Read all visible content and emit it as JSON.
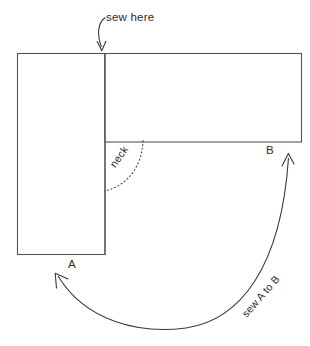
{
  "figure": {
    "background_color": "#ffffff",
    "line_color": "#555555",
    "text_color": "#2b2b2b"
  },
  "labels": {
    "sew_here": "sew here",
    "point_a": "A",
    "point_b": "B",
    "neck": "neck",
    "sew_a_to_b": "sew A to B"
  },
  "shapes": {
    "left_panel": {
      "name": "left rectangle panel",
      "x": 17,
      "y": 53,
      "width": 88,
      "height": 201
    },
    "right_panel": {
      "name": "right rectangle panel",
      "x": 105,
      "y": 53,
      "width": 197,
      "height": 89
    }
  },
  "annotations": {
    "sew_here_arrow": {
      "name": "curved arrow to top seam",
      "from_x": 105,
      "from_y": 17,
      "to_x": 102,
      "to_y": 51
    },
    "neck_arc": {
      "name": "dotted neck curve",
      "style": "dotted",
      "from_x": 143,
      "from_y": 140,
      "to_x": 104,
      "to_y": 191
    },
    "sew_a_to_b_arrow": {
      "name": "double headed curve from A to B",
      "head_1_x": 56,
      "head_1_y": 274,
      "head_2_x": 288,
      "head_2_y": 154
    }
  }
}
